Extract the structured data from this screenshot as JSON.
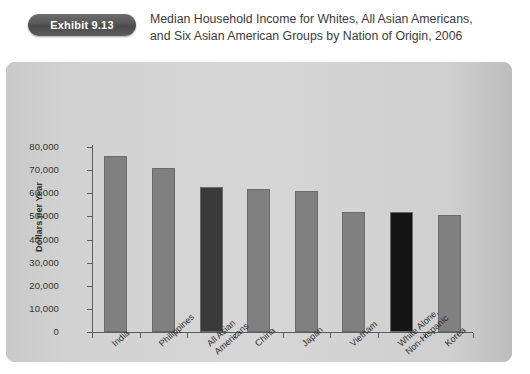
{
  "header": {
    "badge_label": "Exhibit 9.13",
    "title_line_1": "Median Household Income for Whites, All Asian Americans,",
    "title_line_2": "and Six Asian American Groups by Nation of Origin, 2006"
  },
  "colors": {
    "page_background": "#ffffff",
    "panel_background": "#a8a8a8",
    "plot_background": "#d4d4d4",
    "bar_default": "#808080",
    "bar_highlight_dark_gray": "#3a3a3a",
    "bar_highlight_black": "#141414",
    "axis": "#5d5d5d",
    "badge_background": "#575757",
    "badge_text": "#ffffff",
    "title_text": "#3b3b3b"
  },
  "chart_data": {
    "type": "bar",
    "title": "Median Household Income for Whites, All Asian Americans, and Six Asian American Groups by Nation of Origin, 2006",
    "xlabel": "",
    "ylabel": "Dollars per Year",
    "ylim": [
      0,
      80000
    ],
    "ytick_values": [
      0,
      10000,
      20000,
      30000,
      40000,
      50000,
      60000,
      70000,
      80000
    ],
    "ytick_labels": [
      "0",
      "10,000",
      "20,000",
      "30,000",
      "40,000",
      "50,000",
      "60,000",
      "70,000",
      "80,000"
    ],
    "grid": false,
    "legend": "none",
    "categories": [
      "India",
      "Philippines",
      "All Asian Americans",
      "China",
      "Japan",
      "Vietnam",
      "White Alone, Non-Hispanic",
      "Korea"
    ],
    "category_label_lines": [
      [
        "India"
      ],
      [
        "Philippines"
      ],
      [
        "All Asian",
        "Americans"
      ],
      [
        "China"
      ],
      [
        "Japan"
      ],
      [
        "Vietnam"
      ],
      [
        "White Alone,",
        "Non-Hispanic"
      ],
      [
        "Korea"
      ]
    ],
    "values": [
      76000,
      71000,
      62500,
      62000,
      61000,
      52000,
      52000,
      50500
    ],
    "bar_colors": [
      "#808080",
      "#808080",
      "#3a3a3a",
      "#808080",
      "#808080",
      "#808080",
      "#141414",
      "#808080"
    ]
  }
}
